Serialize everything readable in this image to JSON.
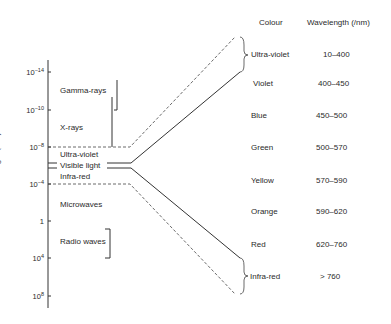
{
  "diagram": {
    "axis": {
      "label": "Wavelength (λ/m)",
      "ticks": [
        {
          "base": "10",
          "exp": "−14"
        },
        {
          "base": "10",
          "exp": "−10"
        },
        {
          "base": "10",
          "exp": "−8"
        },
        {
          "base": "10",
          "exp": "−4"
        },
        {
          "base": "1",
          "exp": ""
        },
        {
          "base": "10",
          "exp": "4"
        },
        {
          "base": "10",
          "exp": "8"
        }
      ]
    },
    "regions": {
      "gamma": "Gamma-rays",
      "xray": "X-rays",
      "uv": "Ultra-violet",
      "visible": "Visible light",
      "ir": "Infra-red",
      "micro": "Microwaves",
      "radio": "Radio waves"
    },
    "table": {
      "header_colour": "Colour",
      "header_wavelength": "Wavelength (/nm)",
      "rows": [
        {
          "colour": "Ultra-violet",
          "range": "10–400"
        },
        {
          "colour": "Violet",
          "range": "400–450"
        },
        {
          "colour": "Blue",
          "range": "450–500"
        },
        {
          "colour": "Green",
          "range": "500–570"
        },
        {
          "colour": "Yellow",
          "range": "570–590"
        },
        {
          "colour": "Orange",
          "range": "590–620"
        },
        {
          "colour": "Red",
          "range": "620–760"
        },
        {
          "colour": "Infra-red",
          "range": "> 760"
        }
      ]
    }
  }
}
